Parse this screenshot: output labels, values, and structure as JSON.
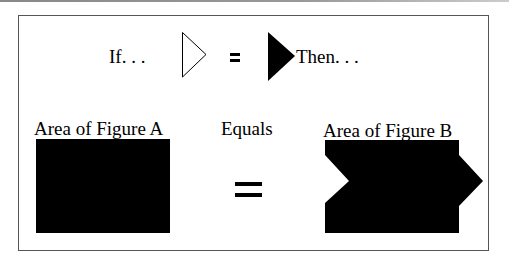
{
  "top_row": {
    "if_label": "If. . .",
    "equals_symbol": "=",
    "then_label": "Then. . ."
  },
  "bottom_row": {
    "figure_a_label": "Area of Figure A",
    "equals_label": "Equals",
    "figure_b_label": "Area of Figure B",
    "equals_symbol": "="
  },
  "colors": {
    "fill": "#000000",
    "border": "#555555",
    "background": "#ffffff"
  }
}
